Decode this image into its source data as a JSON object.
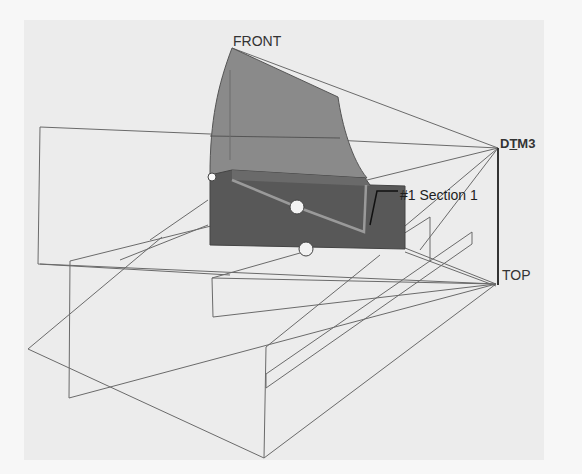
{
  "view": {
    "background_color": "#f7f7f7",
    "canvas_color": "#ececec",
    "line_color": "#666666",
    "surface_light_color": "#8a8a8a",
    "surface_dark_color": "#555555"
  },
  "datum_planes": {
    "front": {
      "label": "FRONT"
    },
    "dtm3": {
      "label_prefix": "D",
      "label_underlined": "T",
      "label_suffix": "M3"
    },
    "top": {
      "label": "TOP"
    }
  },
  "section": {
    "label": "#1 Section 1"
  },
  "handles": [
    {
      "name": "edge-handle-left",
      "cx": 212,
      "cy": 177,
      "r": 4
    },
    {
      "name": "drag-handle-center",
      "cx": 297,
      "cy": 207,
      "r": 7
    },
    {
      "name": "drag-handle-bottom",
      "cx": 306,
      "cy": 249,
      "r": 7
    }
  ]
}
